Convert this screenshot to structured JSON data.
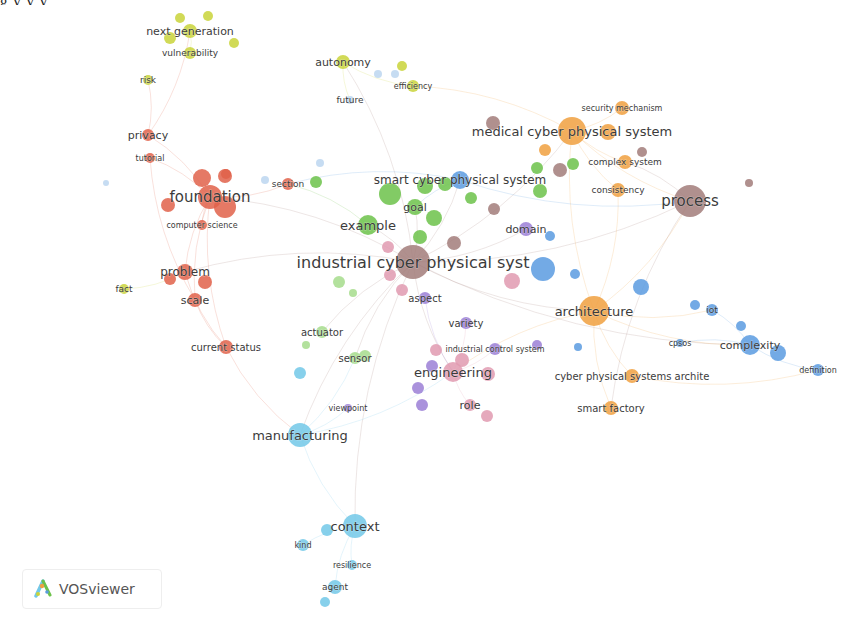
{
  "caption_fragment": "g                                   y                                   y                                   y",
  "brand": {
    "name": "VOSviewer",
    "icon": "vosviewer-logo-icon"
  },
  "clusters": {
    "red": "#e0614a",
    "green": "#6cc24a",
    "blue": "#5b9be0",
    "yellow": "#c9d43a",
    "purple": "#9b7fd6",
    "lightblue": "#72c8e8",
    "orange": "#f0a040",
    "brown": "#a27d7a",
    "pink": "#e09ab0",
    "lightgreen": "#a6dc8c",
    "paleblue": "#bcd6f0"
  },
  "chart_data": {
    "type": "network",
    "nodes": [
      {
        "id": "next generation",
        "x": 190,
        "y": 31,
        "r": 7,
        "cluster": "yellow",
        "label": "next generation",
        "fs": 11
      },
      {
        "id": "vulnerability",
        "x": 190,
        "y": 53,
        "r": 6,
        "cluster": "yellow",
        "label": "vulnerability",
        "fs": 9
      },
      {
        "id": "risk",
        "x": 148,
        "y": 80,
        "r": 5,
        "cluster": "yellow",
        "label": "risk",
        "fs": 9
      },
      {
        "id": "autonomy",
        "x": 343,
        "y": 62,
        "r": 7,
        "cluster": "yellow",
        "label": "autonomy",
        "fs": 11
      },
      {
        "id": "efficiency",
        "x": 413,
        "y": 86,
        "r": 6,
        "cluster": "yellow",
        "label": "efficiency",
        "fs": 8
      },
      {
        "id": "future",
        "x": 350,
        "y": 100,
        "r": 4,
        "cluster": "paleblue",
        "label": "future",
        "fs": 9
      },
      {
        "id": "fact",
        "x": 124,
        "y": 289,
        "r": 5,
        "cluster": "yellow",
        "label": "fact",
        "fs": 9
      },
      {
        "id": "privacy",
        "x": 148,
        "y": 135,
        "r": 6,
        "cluster": "red",
        "label": "privacy",
        "fs": 11
      },
      {
        "id": "tutorial",
        "x": 150,
        "y": 158,
        "r": 5,
        "cluster": "red",
        "label": "tutorial",
        "fs": 8
      },
      {
        "id": "foundation",
        "x": 210,
        "y": 197,
        "r": 12,
        "cluster": "red",
        "label": "foundation",
        "fs": 15
      },
      {
        "id": "computer science",
        "x": 202,
        "y": 225,
        "r": 5,
        "cluster": "red",
        "label": "computer science",
        "fs": 8
      },
      {
        "id": "section",
        "x": 288,
        "y": 184,
        "r": 6,
        "cluster": "red",
        "label": "section",
        "fs": 9
      },
      {
        "id": "problem",
        "x": 185,
        "y": 272,
        "r": 8,
        "cluster": "red",
        "label": "problem",
        "fs": 12
      },
      {
        "id": "scale",
        "x": 195,
        "y": 300,
        "r": 7,
        "cluster": "red",
        "label": "scale",
        "fs": 11
      },
      {
        "id": "current status",
        "x": 226,
        "y": 347,
        "r": 7,
        "cluster": "red",
        "label": "current status",
        "fs": 10
      },
      {
        "id": "smart cyber physical system",
        "x": 460,
        "y": 180,
        "r": 9,
        "cluster": "blue",
        "label": "smart cyber physical system",
        "fs": 12
      },
      {
        "id": "goal",
        "x": 415,
        "y": 207,
        "r": 8,
        "cluster": "green",
        "label": "goal",
        "fs": 11
      },
      {
        "id": "example",
        "x": 368,
        "y": 225,
        "r": 10,
        "cluster": "green",
        "label": "example",
        "fs": 13
      },
      {
        "id": "domain",
        "x": 526,
        "y": 229,
        "r": 7,
        "cluster": "purple",
        "label": "domain",
        "fs": 11
      },
      {
        "id": "industrial cyber physical syst",
        "x": 413,
        "y": 262,
        "r": 17,
        "cluster": "brown",
        "label": "industrial cyber physical syst",
        "fs": 16
      },
      {
        "id": "aspect",
        "x": 425,
        "y": 298,
        "r": 6,
        "cluster": "purple",
        "label": "aspect",
        "fs": 10
      },
      {
        "id": "variety",
        "x": 466,
        "y": 323,
        "r": 6,
        "cluster": "purple",
        "label": "variety",
        "fs": 10
      },
      {
        "id": "industrial control system",
        "x": 495,
        "y": 349,
        "r": 6,
        "cluster": "purple",
        "label": "industrial control system",
        "fs": 8
      },
      {
        "id": "engineering",
        "x": 453,
        "y": 372,
        "r": 10,
        "cluster": "pink",
        "label": "engineering",
        "fs": 13
      },
      {
        "id": "role",
        "x": 470,
        "y": 405,
        "r": 6,
        "cluster": "pink",
        "label": "role",
        "fs": 11
      },
      {
        "id": "actuator",
        "x": 322,
        "y": 332,
        "r": 6,
        "cluster": "lightgreen",
        "label": "actuator",
        "fs": 10
      },
      {
        "id": "sensor",
        "x": 355,
        "y": 358,
        "r": 6,
        "cluster": "lightgreen",
        "label": "sensor",
        "fs": 10
      },
      {
        "id": "viewpoint",
        "x": 348,
        "y": 408,
        "r": 4,
        "cluster": "purple",
        "label": "viewpoint",
        "fs": 8
      },
      {
        "id": "manufacturing",
        "x": 300,
        "y": 435,
        "r": 12,
        "cluster": "lightblue",
        "label": "manufacturing",
        "fs": 13
      },
      {
        "id": "context",
        "x": 355,
        "y": 526,
        "r": 12,
        "cluster": "lightblue",
        "label": "context",
        "fs": 13
      },
      {
        "id": "kind",
        "x": 303,
        "y": 545,
        "r": 6,
        "cluster": "lightblue",
        "label": "kind",
        "fs": 8
      },
      {
        "id": "resilience",
        "x": 352,
        "y": 565,
        "r": 5,
        "cluster": "lightblue",
        "label": "resilience",
        "fs": 8
      },
      {
        "id": "agent",
        "x": 335,
        "y": 587,
        "r": 7,
        "cluster": "lightblue",
        "label": "agent",
        "fs": 9
      },
      {
        "id": "medical cyber physical system",
        "x": 572,
        "y": 131,
        "r": 14,
        "cluster": "orange",
        "label": "medical cyber physical system",
        "fs": 13
      },
      {
        "id": "security mechanism",
        "x": 622,
        "y": 108,
        "r": 7,
        "cluster": "orange",
        "label": "security mechanism",
        "fs": 8
      },
      {
        "id": "complex system",
        "x": 625,
        "y": 162,
        "r": 7,
        "cluster": "orange",
        "label": "complex system",
        "fs": 9
      },
      {
        "id": "consistency",
        "x": 618,
        "y": 190,
        "r": 7,
        "cluster": "orange",
        "label": "consistency",
        "fs": 9
      },
      {
        "id": "process",
        "x": 690,
        "y": 201,
        "r": 16,
        "cluster": "brown",
        "label": "process",
        "fs": 15
      },
      {
        "id": "architecture",
        "x": 594,
        "y": 311,
        "r": 15,
        "cluster": "orange",
        "label": "architecture",
        "fs": 13
      },
      {
        "id": "cyber physical systems archite",
        "x": 632,
        "y": 376,
        "r": 7,
        "cluster": "orange",
        "label": "cyber physical systems archite",
        "fs": 10
      },
      {
        "id": "smart factory",
        "x": 611,
        "y": 408,
        "r": 7,
        "cluster": "orange",
        "label": "smart factory",
        "fs": 10
      },
      {
        "id": "iot",
        "x": 712,
        "y": 310,
        "r": 6,
        "cluster": "blue",
        "label": "iot",
        "fs": 9
      },
      {
        "id": "cpsos",
        "x": 680,
        "y": 343,
        "r": 4,
        "cluster": "blue",
        "label": "cpsos",
        "fs": 8
      },
      {
        "id": "complexity",
        "x": 750,
        "y": 345,
        "r": 10,
        "cluster": "blue",
        "label": "complexity",
        "fs": 11
      },
      {
        "id": "definition",
        "x": 818,
        "y": 370,
        "r": 6,
        "cluster": "blue",
        "label": "definition",
        "fs": 8
      }
    ],
    "extra_nodes": [
      {
        "x": 180,
        "y": 18,
        "r": 5,
        "cluster": "yellow"
      },
      {
        "x": 208,
        "y": 16,
        "r": 5,
        "cluster": "yellow"
      },
      {
        "x": 170,
        "y": 38,
        "r": 6,
        "cluster": "yellow"
      },
      {
        "x": 234,
        "y": 43,
        "r": 5,
        "cluster": "yellow"
      },
      {
        "x": 402,
        "y": 66,
        "r": 5,
        "cluster": "yellow"
      },
      {
        "x": 378,
        "y": 74,
        "r": 4,
        "cluster": "paleblue"
      },
      {
        "x": 395,
        "y": 74,
        "r": 4,
        "cluster": "paleblue"
      },
      {
        "x": 202,
        "y": 178,
        "r": 9,
        "cluster": "red"
      },
      {
        "x": 225,
        "y": 176,
        "r": 7,
        "cluster": "red"
      },
      {
        "x": 168,
        "y": 205,
        "r": 7,
        "cluster": "red"
      },
      {
        "x": 225,
        "y": 207,
        "r": 11,
        "cluster": "red"
      },
      {
        "x": 226,
        "y": 174,
        "r": 5,
        "cluster": "red"
      },
      {
        "x": 170,
        "y": 279,
        "r": 6,
        "cluster": "red"
      },
      {
        "x": 205,
        "y": 282,
        "r": 7,
        "cluster": "red"
      },
      {
        "x": 265,
        "y": 180,
        "r": 4,
        "cluster": "paleblue"
      },
      {
        "x": 320,
        "y": 163,
        "r": 4,
        "cluster": "paleblue"
      },
      {
        "x": 106,
        "y": 183,
        "r": 3,
        "cluster": "paleblue"
      },
      {
        "x": 316,
        "y": 182,
        "r": 6,
        "cluster": "green"
      },
      {
        "x": 390,
        "y": 194,
        "r": 11,
        "cluster": "green"
      },
      {
        "x": 425,
        "y": 186,
        "r": 8,
        "cluster": "green"
      },
      {
        "x": 445,
        "y": 184,
        "r": 7,
        "cluster": "green"
      },
      {
        "x": 434,
        "y": 218,
        "r": 8,
        "cluster": "green"
      },
      {
        "x": 420,
        "y": 237,
        "r": 7,
        "cluster": "green"
      },
      {
        "x": 471,
        "y": 198,
        "r": 6,
        "cluster": "green"
      },
      {
        "x": 537,
        "y": 168,
        "r": 6,
        "cluster": "green"
      },
      {
        "x": 573,
        "y": 164,
        "r": 6,
        "cluster": "green"
      },
      {
        "x": 540,
        "y": 191,
        "r": 7,
        "cluster": "green"
      },
      {
        "x": 339,
        "y": 282,
        "r": 6,
        "cluster": "lightgreen"
      },
      {
        "x": 353,
        "y": 293,
        "r": 4,
        "cluster": "lightgreen"
      },
      {
        "x": 306,
        "y": 345,
        "r": 4,
        "cluster": "lightgreen"
      },
      {
        "x": 365,
        "y": 356,
        "r": 6,
        "cluster": "lightgreen"
      },
      {
        "x": 494,
        "y": 209,
        "r": 6,
        "cluster": "brown"
      },
      {
        "x": 560,
        "y": 170,
        "r": 7,
        "cluster": "brown"
      },
      {
        "x": 493,
        "y": 123,
        "r": 7,
        "cluster": "brown"
      },
      {
        "x": 642,
        "y": 152,
        "r": 5,
        "cluster": "brown"
      },
      {
        "x": 749,
        "y": 183,
        "r": 4,
        "cluster": "brown"
      },
      {
        "x": 454,
        "y": 243,
        "r": 7,
        "cluster": "brown"
      },
      {
        "x": 388,
        "y": 247,
        "r": 6,
        "cluster": "pink"
      },
      {
        "x": 390,
        "y": 275,
        "r": 6,
        "cluster": "pink"
      },
      {
        "x": 402,
        "y": 290,
        "r": 6,
        "cluster": "pink"
      },
      {
        "x": 512,
        "y": 281,
        "r": 8,
        "cluster": "pink"
      },
      {
        "x": 436,
        "y": 350,
        "r": 6,
        "cluster": "pink"
      },
      {
        "x": 462,
        "y": 360,
        "r": 7,
        "cluster": "pink"
      },
      {
        "x": 488,
        "y": 374,
        "r": 7,
        "cluster": "pink"
      },
      {
        "x": 487,
        "y": 416,
        "r": 6,
        "cluster": "pink"
      },
      {
        "x": 418,
        "y": 388,
        "r": 6,
        "cluster": "purple"
      },
      {
        "x": 422,
        "y": 405,
        "r": 6,
        "cluster": "purple"
      },
      {
        "x": 432,
        "y": 366,
        "r": 6,
        "cluster": "purple"
      },
      {
        "x": 537,
        "y": 345,
        "r": 5,
        "cluster": "purple"
      },
      {
        "x": 543,
        "y": 269,
        "r": 12,
        "cluster": "blue"
      },
      {
        "x": 550,
        "y": 236,
        "r": 5,
        "cluster": "blue"
      },
      {
        "x": 575,
        "y": 274,
        "r": 5,
        "cluster": "blue"
      },
      {
        "x": 641,
        "y": 287,
        "r": 8,
        "cluster": "blue"
      },
      {
        "x": 578,
        "y": 347,
        "r": 4,
        "cluster": "blue"
      },
      {
        "x": 695,
        "y": 305,
        "r": 5,
        "cluster": "blue"
      },
      {
        "x": 741,
        "y": 326,
        "r": 5,
        "cluster": "blue"
      },
      {
        "x": 778,
        "y": 353,
        "r": 8,
        "cluster": "blue"
      },
      {
        "x": 300,
        "y": 373,
        "r": 6,
        "cluster": "lightblue"
      },
      {
        "x": 327,
        "y": 530,
        "r": 6,
        "cluster": "lightblue"
      },
      {
        "x": 325,
        "y": 602,
        "r": 5,
        "cluster": "lightblue"
      },
      {
        "x": 608,
        "y": 132,
        "r": 8,
        "cluster": "orange"
      },
      {
        "x": 545,
        "y": 150,
        "r": 6,
        "cluster": "orange"
      }
    ],
    "edges": [
      [
        "industrial cyber physical syst",
        "foundation"
      ],
      [
        "industrial cyber physical syst",
        "process"
      ],
      [
        "industrial cyber physical syst",
        "architecture"
      ],
      [
        "industrial cyber physical syst",
        "manufacturing"
      ],
      [
        "industrial cyber physical syst",
        "medical cyber physical system"
      ],
      [
        "industrial cyber physical syst",
        "engineering"
      ],
      [
        "industrial cyber physical syst",
        "example"
      ],
      [
        "industrial cyber physical syst",
        "goal"
      ],
      [
        "industrial cyber physical syst",
        "smart cyber physical system"
      ],
      [
        "industrial cyber physical syst",
        "autonomy"
      ],
      [
        "industrial cyber physical syst",
        "problem"
      ],
      [
        "industrial cyber physical syst",
        "complexity"
      ],
      [
        "industrial cyber physical syst",
        "domain"
      ],
      [
        "industrial cyber physical syst",
        "context"
      ],
      [
        "industrial cyber physical syst",
        "actuator"
      ],
      [
        "industrial cyber physical syst",
        "sensor"
      ],
      [
        "foundation",
        "privacy"
      ],
      [
        "foundation",
        "tutorial"
      ],
      [
        "foundation",
        "computer science"
      ],
      [
        "foundation",
        "problem"
      ],
      [
        "foundation",
        "scale"
      ],
      [
        "foundation",
        "section"
      ],
      [
        "foundation",
        "current status"
      ],
      [
        "privacy",
        "next generation"
      ],
      [
        "privacy",
        "risk"
      ],
      [
        "tutorial",
        "scale"
      ],
      [
        "problem",
        "current status"
      ],
      [
        "scale",
        "current status"
      ],
      [
        "fact",
        "problem"
      ],
      [
        "current status",
        "manufacturing"
      ],
      [
        "medical cyber physical system",
        "security mechanism"
      ],
      [
        "medical cyber physical system",
        "complex system"
      ],
      [
        "medical cyber physical system",
        "consistency"
      ],
      [
        "medical cyber physical system",
        "process"
      ],
      [
        "medical cyber physical system",
        "architecture"
      ],
      [
        "medical cyber physical system",
        "efficiency"
      ],
      [
        "architecture",
        "cyber physical systems archite"
      ],
      [
        "architecture",
        "smart factory"
      ],
      [
        "architecture",
        "process"
      ],
      [
        "architecture",
        "complexity"
      ],
      [
        "architecture",
        "iot"
      ],
      [
        "architecture",
        "consistency"
      ],
      [
        "cyber physical systems archite",
        "definition"
      ],
      [
        "complexity",
        "definition"
      ],
      [
        "complexity",
        "iot"
      ],
      [
        "complexity",
        "cpsos"
      ],
      [
        "manufacturing",
        "context"
      ],
      [
        "context",
        "kind"
      ],
      [
        "context",
        "resilience"
      ],
      [
        "context",
        "agent"
      ],
      [
        "manufacturing",
        "sensor"
      ],
      [
        "manufacturing",
        "engineering"
      ],
      [
        "engineering",
        "role"
      ],
      [
        "engineering",
        "variety"
      ],
      [
        "engineering",
        "industrial control system"
      ],
      [
        "aspect",
        "engineering"
      ],
      [
        "smart cyber physical system",
        "goal"
      ],
      [
        "smart cyber physical system",
        "section"
      ],
      [
        "smart cyber physical system",
        "process"
      ],
      [
        "example",
        "section"
      ],
      [
        "autonomy",
        "efficiency"
      ],
      [
        "autonomy",
        "future"
      ],
      [
        "vulnerability",
        "next generation"
      ],
      [
        "process",
        "complex system"
      ],
      [
        "process",
        "smart factory"
      ],
      [
        "architecture",
        "engineering"
      ],
      [
        "manufacturing",
        "viewpoint"
      ]
    ]
  }
}
